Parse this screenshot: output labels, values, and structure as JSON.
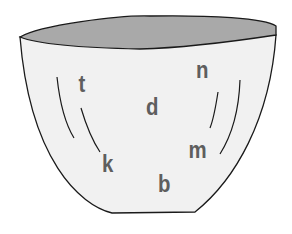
{
  "illustration": {
    "subject": "bowl",
    "colors": {
      "bowl_body": "#f1f1f1",
      "bowl_inside": "#a9a9a9",
      "outline": "#1a1a1a",
      "letter": "#5e5e5e"
    },
    "letters": [
      {
        "char": "t",
        "x": 78,
        "y": 72
      },
      {
        "char": "n",
        "x": 195,
        "y": 58
      },
      {
        "char": "d",
        "x": 145,
        "y": 95
      },
      {
        "char": "m",
        "x": 187,
        "y": 138
      },
      {
        "char": "k",
        "x": 101,
        "y": 152
      },
      {
        "char": "b",
        "x": 157,
        "y": 172
      }
    ]
  }
}
